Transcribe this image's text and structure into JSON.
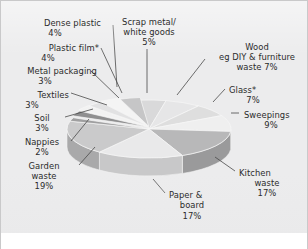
{
  "chart_data": {
    "type": "pie",
    "title": "",
    "subtitle": "",
    "xlabel": "",
    "ylabel": "",
    "legend_position": "labels-with-leader-lines",
    "grid": false,
    "units": "percent",
    "total": 100,
    "categories": [
      "Scrap metal/ white goods",
      "Wood eg DIY & furniture waste",
      "Glass*",
      "Sweepings",
      "Kitchen waste",
      "Paper & board",
      "Garden waste",
      "Nappies",
      "Soil",
      "Textiles",
      "Metal packaging",
      "Plastic film*",
      "Dense plastic"
    ],
    "values": [
      5,
      7,
      7,
      9,
      17,
      17,
      19,
      2,
      3,
      3,
      3,
      4,
      4
    ],
    "slices": [
      {
        "key": "scrap_metal",
        "line1": "Scrap metal/",
        "line2": "white goods",
        "line3": "5%",
        "value": 5,
        "pct_label": "5%",
        "fill": "#d9d9da",
        "side": "#b9b9ba"
      },
      {
        "key": "wood",
        "line1": "Wood",
        "line2": "eg DIY & furniture",
        "line3": "waste 7%",
        "value": 7,
        "pct_label": "7%",
        "fill": "#e6e6e7",
        "side": "#c4c4c5"
      },
      {
        "key": "glass",
        "line1": "Glass*",
        "line2": "7%",
        "line3": "",
        "value": 7,
        "pct_label": "7%",
        "fill": "#dedede",
        "side": "#bcbcbd"
      },
      {
        "key": "sweepings",
        "line1": "Sweepings",
        "line2": "9%",
        "line3": "",
        "value": 9,
        "pct_label": "9%",
        "fill": "#efefef",
        "side": "#cdcdce"
      },
      {
        "key": "kitchen_waste",
        "line1": "Kitchen",
        "line2": "waste",
        "line3": "17%",
        "value": 17,
        "pct_label": "17%",
        "fill": "#b8b8b9",
        "side": "#9a9a9b"
      },
      {
        "key": "paper_board",
        "line1": "Paper &",
        "line2": "board",
        "line3": "17%",
        "value": 17,
        "pct_label": "17%",
        "fill": "#e9e9ea",
        "side": "#c8c8c9"
      },
      {
        "key": "garden_waste",
        "line1": "Garden",
        "line2": "waste",
        "line3": "19%",
        "value": 19,
        "pct_label": "19%",
        "fill": "#cacacb",
        "side": "#a9a9aa"
      },
      {
        "key": "nappies",
        "line1": "Nappies",
        "line2": "2%",
        "line3": "",
        "value": 2,
        "pct_label": "2%",
        "fill": "#9f9fa0",
        "side": "#868687"
      },
      {
        "key": "soil",
        "line1": "Soil",
        "line2": "3%",
        "line3": "",
        "value": 3,
        "pct_label": "3%",
        "fill": "#8f8f90",
        "side": "#787879"
      },
      {
        "key": "textiles",
        "line1": "Textiles",
        "line2": "3%",
        "line3": "",
        "value": 3,
        "pct_label": "3%",
        "fill": "#f2f2f2",
        "side": "#d2d2d3"
      },
      {
        "key": "metal_packaging",
        "line1": "Metal packaging",
        "line2": "3%",
        "line3": "",
        "value": 3,
        "pct_label": "3%",
        "fill": "#e2e2e3",
        "side": "#c1c1c2"
      },
      {
        "key": "plastic_film",
        "line1": "Plastic film*",
        "line2": "4%",
        "line3": "",
        "value": 4,
        "pct_label": "4%",
        "fill": "#f4f4f4",
        "side": "#d4d4d5"
      },
      {
        "key": "dense_plastic",
        "line1": "Dense plastic",
        "line2": "4%",
        "line3": "",
        "value": 4,
        "pct_label": "4%",
        "fill": "#c6c6c7",
        "side": "#a6a6a7"
      }
    ]
  },
  "labels": {
    "dense_plastic": {
      "l1": "Dense plastic",
      "l2": "4%"
    },
    "plastic_film": {
      "l1": "Plastic film*",
      "l2": "4%"
    },
    "metal_packaging": {
      "l1": "Metal packaging",
      "l2": "3%"
    },
    "textiles": {
      "l1": "Textiles",
      "l2": "3%"
    },
    "soil": {
      "l1": "Soil",
      "l2": "3%"
    },
    "nappies": {
      "l1": "Nappies",
      "l2": "2%"
    },
    "garden_waste": {
      "l1": "Garden",
      "l2": "waste",
      "l3": "19%"
    },
    "scrap_metal": {
      "l1": "Scrap metal/",
      "l2": "white goods",
      "l3": "5%"
    },
    "wood": {
      "l1": "Wood",
      "l2": "eg DIY & furniture",
      "l3": "waste 7%"
    },
    "glass": {
      "l1": "Glass*",
      "l2": "7%"
    },
    "sweepings": {
      "l1": "Sweepings",
      "l2": "9%"
    },
    "kitchen_waste": {
      "l1": "Kitchen",
      "l2": "waste",
      "l3": "17%"
    },
    "paper_board": {
      "l1": "Paper &",
      "l2": "board",
      "l3": "17%"
    }
  },
  "colors": {
    "background": "#ececed",
    "border": "#c9c9ca",
    "text": "#2b2b2b",
    "leader_line": "#4a4a4a",
    "slice_edge": "#f6f6f6"
  }
}
